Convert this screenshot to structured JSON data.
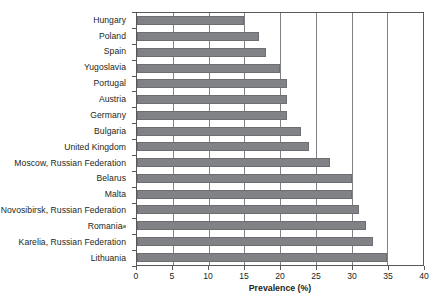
{
  "chart_data": {
    "type": "bar",
    "orientation": "horizontal",
    "title": "",
    "xlabel": "Prevalence (%)",
    "ylabel": "",
    "xlim": [
      0,
      40
    ],
    "xticks": [
      0,
      5,
      10,
      15,
      20,
      25,
      30,
      35,
      40
    ],
    "xtick_labels": [
      "0",
      "5",
      "10",
      "15",
      "20",
      "25",
      "30",
      "35",
      "40"
    ],
    "grid": "vertical",
    "legend": "none",
    "bar_color": "#808285",
    "categories": [
      "Hungary",
      "Poland",
      "Spain",
      "Yugoslavia",
      "Portugal",
      "Austria",
      "Germany",
      "Bulgaria",
      "United Kingdom",
      "Moscow, Russian Federation",
      "Belarus",
      "Malta",
      "Novosibirsk, Russian Federation",
      "Romania",
      "Karelia, Russian Federation",
      "Lithuania"
    ],
    "category_footnotes": [
      "",
      "",
      "",
      "",
      "",
      "",
      "",
      "",
      "",
      "",
      "",
      "",
      "",
      "a",
      "",
      ""
    ],
    "values": [
      15,
      17,
      18,
      20,
      21,
      21,
      21,
      23,
      24,
      27,
      30,
      30,
      31,
      32,
      33,
      35
    ]
  }
}
